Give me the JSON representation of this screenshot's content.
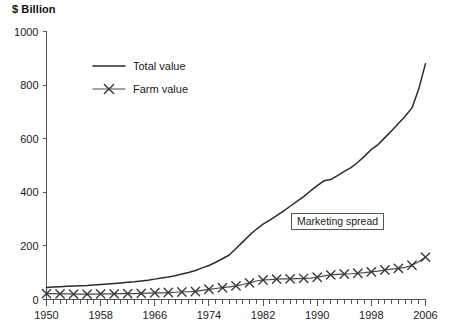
{
  "chart_data": {
    "type": "line",
    "title": "",
    "subtitle": "",
    "ylabel": "$ Billion",
    "xlabel": "",
    "ylim": [
      0,
      1000
    ],
    "xlim": [
      1950,
      2006
    ],
    "yticks": [
      0,
      200,
      400,
      600,
      800,
      1000
    ],
    "ytick_labels": [
      "0",
      "200",
      "400",
      "600",
      "800",
      "1000"
    ],
    "xticks": [
      1950,
      1958,
      1966,
      1974,
      1982,
      1990,
      1998,
      2006
    ],
    "xtick_labels": [
      "1950",
      "1958",
      "1966",
      "1974",
      "1982",
      "1990",
      "1998",
      "2006"
    ],
    "x_minor_tick_step": 1,
    "grid": false,
    "legend_position": "upper-left-inside",
    "annotations": [
      {
        "text": "Marketing spread",
        "x": 1993,
        "y": 290,
        "boxed": true
      }
    ],
    "x": [
      1950,
      1951,
      1952,
      1953,
      1954,
      1955,
      1956,
      1957,
      1958,
      1959,
      1960,
      1961,
      1962,
      1963,
      1964,
      1965,
      1966,
      1967,
      1968,
      1969,
      1970,
      1971,
      1972,
      1973,
      1974,
      1975,
      1976,
      1977,
      1978,
      1979,
      1980,
      1981,
      1982,
      1983,
      1984,
      1985,
      1986,
      1987,
      1988,
      1989,
      1990,
      1991,
      1992,
      1993,
      1994,
      1995,
      1996,
      1997,
      1998,
      1999,
      2000,
      2001,
      2002,
      2003,
      2004,
      2005,
      2006
    ],
    "series": [
      {
        "name": "Total value",
        "marker": "none",
        "linestyle": "solid",
        "color": "#2b2b2b",
        "values": [
          45,
          47,
          48,
          49,
          50,
          51,
          52,
          54,
          56,
          58,
          60,
          62,
          64,
          66,
          69,
          72,
          76,
          80,
          84,
          89,
          95,
          101,
          108,
          118,
          127,
          139,
          152,
          166,
          190,
          215,
          240,
          262,
          281,
          296,
          313,
          330,
          348,
          366,
          384,
          405,
          425,
          443,
          448,
          462,
          478,
          492,
          512,
          535,
          560,
          578,
          604,
          630,
          657,
          684,
          715,
          785,
          880
        ]
      },
      {
        "name": "Farm value",
        "marker": "x",
        "marker_interval_years": 2,
        "linestyle": "solid",
        "color": "#4a4a4a",
        "values": [
          22,
          22,
          21,
          21,
          20,
          20,
          20,
          20,
          21,
          21,
          21,
          22,
          22,
          22,
          23,
          24,
          25,
          25,
          26,
          27,
          28,
          29,
          30,
          34,
          38,
          41,
          44,
          47,
          51,
          56,
          62,
          69,
          73,
          74,
          76,
          77,
          77,
          78,
          79,
          80,
          83,
          88,
          92,
          94,
          95,
          96,
          98,
          100,
          103,
          106,
          110,
          113,
          116,
          120,
          128,
          141,
          158
        ]
      }
    ],
    "legend": [
      {
        "label": "Total value",
        "marker": "none"
      },
      {
        "label": "Farm value",
        "marker": "x"
      }
    ]
  },
  "colors": {
    "background": "#ffffff",
    "axis": "#555555",
    "total_value_line": "#2b2b2b",
    "farm_value_line": "#4a4a4a",
    "text": "#1a1a1a"
  }
}
